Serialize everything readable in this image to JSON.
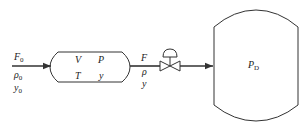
{
  "inlet": {
    "flow": "F",
    "flow_sub": "0",
    "density": "ρ",
    "density_sub": "0",
    "composition": "y",
    "composition_sub": "0"
  },
  "tank": {
    "volume": "V",
    "pressure": "P",
    "temperature": "T",
    "composition": "y"
  },
  "outlet": {
    "flow": "F",
    "density": "ρ",
    "composition": "y"
  },
  "drum": {
    "pressure": "P",
    "pressure_sub": "D"
  },
  "colors": {
    "line": "#333333",
    "background": "#ffffff"
  }
}
